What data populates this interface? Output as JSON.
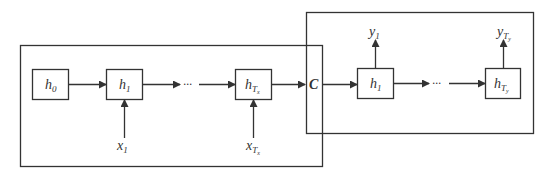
{
  "diagram": {
    "type": "encoder-decoder RNN (seq2seq)",
    "colors": {
      "stroke": "#333333",
      "background": "#ffffff"
    },
    "encoder": {
      "nodes": [
        {
          "id": "enc-h0",
          "label": "h",
          "sub": "0"
        },
        {
          "id": "enc-h1",
          "label": "h",
          "sub": "1"
        },
        {
          "id": "enc-hTx",
          "label": "h",
          "sub": "T",
          "subsub": "x"
        }
      ],
      "inputs": [
        {
          "id": "x1",
          "label": "x",
          "sub": "1"
        },
        {
          "id": "xTx",
          "label": "x",
          "sub": "T",
          "subsub": "x"
        }
      ],
      "ellipsis": "···"
    },
    "context": {
      "label": "C"
    },
    "decoder": {
      "nodes": [
        {
          "id": "dec-h1",
          "label": "h",
          "sub": "1"
        },
        {
          "id": "dec-hTy",
          "label": "h",
          "sub": "T",
          "subsub": "y"
        }
      ],
      "outputs": [
        {
          "id": "y1",
          "label": "y",
          "sub": "1"
        },
        {
          "id": "yTy",
          "label": "y",
          "sub": "T",
          "subsub": "y"
        }
      ],
      "ellipsis": "···"
    }
  }
}
